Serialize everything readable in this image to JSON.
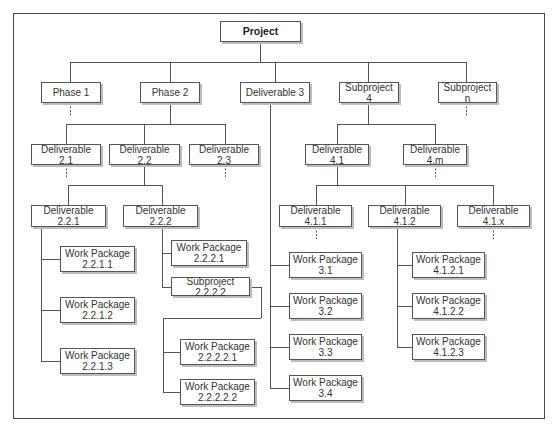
{
  "diagram": {
    "title": "Project",
    "frame": {
      "x": 13,
      "y": 13,
      "w": 532,
      "h": 406
    },
    "colors": {
      "line": "#555555",
      "border": "#555555",
      "text": "#333333",
      "shadow": "#bdbdbd"
    },
    "nodes": [
      {
        "id": "project",
        "label": "Project",
        "x": 220,
        "y": 21,
        "w": 81,
        "h": 21,
        "root": true
      },
      {
        "id": "phase-1",
        "label": "Phase 1",
        "x": 41,
        "y": 82,
        "w": 60,
        "h": 21
      },
      {
        "id": "phase-2",
        "label": "Phase 2",
        "x": 140,
        "y": 82,
        "w": 60,
        "h": 21
      },
      {
        "id": "deliverable-3",
        "label": "Deliverable 3",
        "x": 240,
        "y": 82,
        "w": 70,
        "h": 21
      },
      {
        "id": "subproject-4",
        "label": "Subproject 4",
        "x": 339,
        "y": 82,
        "w": 60,
        "h": 21
      },
      {
        "id": "subproject-n",
        "label": "Subproject n",
        "x": 438,
        "y": 82,
        "w": 59,
        "h": 21
      },
      {
        "id": "deliverable-2-1",
        "label": "Deliverable 2.1",
        "x": 31,
        "y": 144,
        "w": 70,
        "h": 21
      },
      {
        "id": "deliverable-2-2",
        "label": "Deliverable 2.2",
        "x": 109,
        "y": 144,
        "w": 71,
        "h": 21
      },
      {
        "id": "deliverable-2-3",
        "label": "Deliverable 2.3",
        "x": 189,
        "y": 144,
        "w": 70,
        "h": 21
      },
      {
        "id": "deliverable-2-2-1",
        "label": "Deliverable 2.2.1",
        "x": 31,
        "y": 205,
        "w": 75,
        "h": 22
      },
      {
        "id": "deliverable-2-2-2",
        "label": "Deliverable 2.2.2",
        "x": 123,
        "y": 205,
        "w": 75,
        "h": 22
      },
      {
        "id": "wp-2-2-1-1",
        "label": "Work Package\n2.2.1.1",
        "x": 60,
        "y": 246,
        "w": 75,
        "h": 26
      },
      {
        "id": "wp-2-2-1-2",
        "label": "Work Package\n2.2.1.2",
        "x": 60,
        "y": 297,
        "w": 75,
        "h": 26
      },
      {
        "id": "wp-2-2-1-3",
        "label": "Work Package\n2.2.1.3",
        "x": 60,
        "y": 348,
        "w": 75,
        "h": 26
      },
      {
        "id": "wp-2-2-2-1",
        "label": "Work Package\n2.2.2.1",
        "x": 171,
        "y": 240,
        "w": 76,
        "h": 26
      },
      {
        "id": "subproject-2-2-2-2",
        "label": "Subproject 2.2.2.2",
        "x": 171,
        "y": 277,
        "w": 79,
        "h": 19
      },
      {
        "id": "wp-2-2-2-2-1",
        "label": "Work Package\n2.2.2.2.1",
        "x": 180,
        "y": 339,
        "w": 75,
        "h": 26
      },
      {
        "id": "wp-2-2-2-2-2",
        "label": "Work Package\n2.2.2.2.2",
        "x": 180,
        "y": 379,
        "w": 75,
        "h": 26
      },
      {
        "id": "deliverable-4-1",
        "label": "Deliverable 4.1",
        "x": 305,
        "y": 144,
        "w": 64,
        "h": 21
      },
      {
        "id": "deliverable-4-m",
        "label": "Deliverable 4.m",
        "x": 403,
        "y": 144,
        "w": 64,
        "h": 21
      },
      {
        "id": "deliverable-4-1-1",
        "label": "Deliverable 4.1.1",
        "x": 279,
        "y": 205,
        "w": 73,
        "h": 22
      },
      {
        "id": "deliverable-4-1-2",
        "label": "Deliverable 4.1.2",
        "x": 368,
        "y": 205,
        "w": 73,
        "h": 22
      },
      {
        "id": "deliverable-4-1-x",
        "label": "Deliverable 4.1.x",
        "x": 457,
        "y": 205,
        "w": 73,
        "h": 22
      },
      {
        "id": "wp-3-1",
        "label": "Work Package\n3.1",
        "x": 289,
        "y": 252,
        "w": 73,
        "h": 26
      },
      {
        "id": "wp-3-2",
        "label": "Work Package\n3.2",
        "x": 289,
        "y": 293,
        "w": 73,
        "h": 26
      },
      {
        "id": "wp-3-3",
        "label": "Work Package\n3.3",
        "x": 289,
        "y": 334,
        "w": 73,
        "h": 26
      },
      {
        "id": "wp-3-4",
        "label": "Work Package\n3.4",
        "x": 289,
        "y": 375,
        "w": 73,
        "h": 26
      },
      {
        "id": "wp-4-1-2-1",
        "label": "Work Package\n4.1.2.1",
        "x": 412,
        "y": 252,
        "w": 73,
        "h": 26
      },
      {
        "id": "wp-4-1-2-2",
        "label": "Work Package\n4.1.2.2",
        "x": 412,
        "y": 293,
        "w": 73,
        "h": 26
      },
      {
        "id": "wp-4-1-2-3",
        "label": "Work Package\n4.1.2.3",
        "x": 412,
        "y": 334,
        "w": 73,
        "h": 26
      }
    ],
    "lines": [
      [
        260,
        42,
        260,
        62
      ],
      [
        70,
        62,
        466,
        62
      ],
      [
        70,
        62,
        70,
        82
      ],
      [
        170,
        62,
        170,
        82
      ],
      [
        275,
        62,
        275,
        82
      ],
      [
        368,
        62,
        368,
        82
      ],
      [
        466,
        62,
        466,
        82
      ],
      [
        170,
        103,
        170,
        124
      ],
      [
        66,
        124,
        225,
        124
      ],
      [
        66,
        124,
        66,
        144
      ],
      [
        144,
        124,
        144,
        144
      ],
      [
        225,
        124,
        225,
        144
      ],
      [
        144,
        165,
        144,
        185
      ],
      [
        68,
        185,
        162,
        185
      ],
      [
        68,
        185,
        68,
        205
      ],
      [
        162,
        185,
        162,
        205
      ],
      [
        41,
        227,
        41,
        361
      ],
      [
        41,
        259,
        60,
        259
      ],
      [
        41,
        310,
        60,
        310
      ],
      [
        41,
        361,
        60,
        361
      ],
      [
        162,
        227,
        162,
        287
      ],
      [
        162,
        253,
        171,
        253
      ],
      [
        162,
        287,
        171,
        287
      ],
      [
        250,
        287,
        261,
        287
      ],
      [
        261,
        287,
        261,
        318
      ],
      [
        163,
        318,
        261,
        318
      ],
      [
        163,
        318,
        163,
        392
      ],
      [
        163,
        352,
        180,
        352
      ],
      [
        163,
        392,
        180,
        392
      ],
      [
        270,
        103,
        270,
        388
      ],
      [
        270,
        265,
        289,
        265
      ],
      [
        270,
        306,
        289,
        306
      ],
      [
        270,
        347,
        289,
        347
      ],
      [
        270,
        388,
        289,
        388
      ],
      [
        368,
        103,
        368,
        124
      ],
      [
        337,
        124,
        435,
        124
      ],
      [
        337,
        124,
        337,
        144
      ],
      [
        435,
        124,
        435,
        144
      ],
      [
        337,
        165,
        337,
        185
      ],
      [
        316,
        185,
        493,
        185
      ],
      [
        316,
        185,
        316,
        205
      ],
      [
        405,
        185,
        405,
        205
      ],
      [
        493,
        185,
        493,
        205
      ],
      [
        397,
        227,
        397,
        347
      ],
      [
        397,
        265,
        412,
        265
      ],
      [
        397,
        306,
        412,
        306
      ],
      [
        397,
        347,
        412,
        347
      ]
    ],
    "dashed_stubs": [
      [
        70,
        103,
        70,
        116
      ],
      [
        466,
        103,
        466,
        116
      ],
      [
        66,
        165,
        66,
        177
      ],
      [
        225,
        165,
        225,
        177
      ],
      [
        435,
        165,
        435,
        177
      ],
      [
        316,
        227,
        316,
        239
      ],
      [
        493,
        227,
        493,
        239
      ]
    ]
  }
}
